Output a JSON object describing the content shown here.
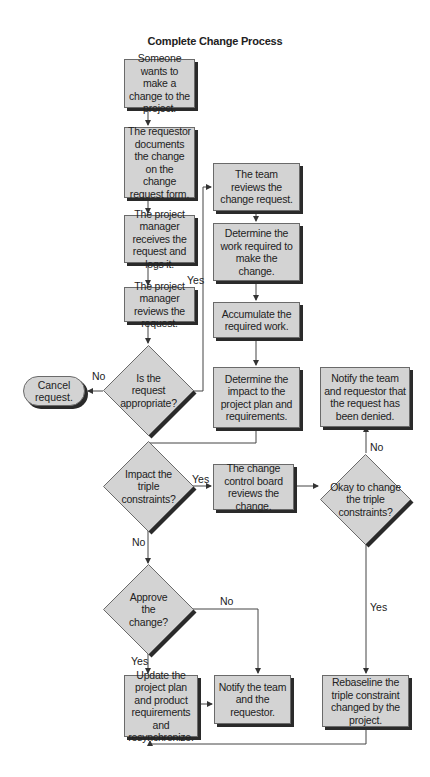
{
  "title": "Complete Change Process",
  "nodes": {
    "start": "Someone wants to make a change to the project.",
    "document": "The requestor documents the change on the change request form.",
    "logs": "The project manager receives the request and logs it.",
    "pm_review": "The project manager reviews the request.",
    "appropriate": "Is the request appropriate?",
    "cancel": "Cancel request.",
    "team_review": "The team reviews the change request.",
    "determine_work": "Determine the work required to make the change.",
    "accumulate": "Accumulate the required work.",
    "determine_impact": "Determine the impact to the project plan and requirements.",
    "impact_triple": "Impact the triple constraints?",
    "ccb": "The change control board reviews the change.",
    "okay_triple": "Okay to change the triple constraints?",
    "notify_denied": "Notify the team and requestor that the request has been denied.",
    "approve": "Approve the change?",
    "update_plan": "Update the project plan and product requirements and resynchronize.",
    "notify_team": "Notify the team and the requestor.",
    "rebaseline": "Rebaseline the triple constraint changed by the project."
  },
  "edge_labels": {
    "appropriate_no": "No",
    "appropriate_yes": "Yes",
    "impact_yes": "Yes",
    "impact_no": "No",
    "okay_no": "No",
    "okay_yes": "Yes",
    "approve_no": "No",
    "approve_yes": "Yes"
  },
  "colors": {
    "shape_fill": "#d3d3d3",
    "shape_border": "#6a6a6a",
    "shadow": "#2a2a2a",
    "line": "#333333"
  }
}
